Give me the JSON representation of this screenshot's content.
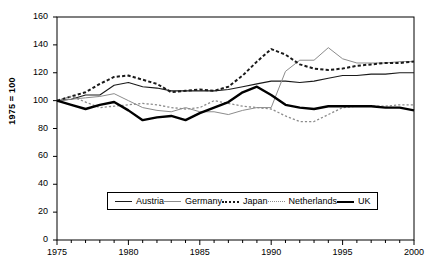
{
  "chart_data": {
    "type": "line",
    "title": "",
    "subtitle": "",
    "xlabel": "",
    "ylabel": "1975 = 100",
    "xlim": [
      1975,
      2000
    ],
    "ylim": [
      0,
      160
    ],
    "grid": false,
    "legend_position": "bottom-center",
    "ytick_labels": [
      "0",
      "20",
      "40",
      "60",
      "80",
      "100",
      "120",
      "140",
      "160"
    ],
    "yticks": [
      0,
      20,
      40,
      60,
      80,
      100,
      120,
      140,
      160
    ],
    "xtick_labels": [
      "1975",
      "1980",
      "1985",
      "1990",
      "1995",
      "2000"
    ],
    "xticks": [
      1975,
      1980,
      1985,
      1990,
      1995,
      2000
    ],
    "minor_xtick_interval": 1,
    "x": [
      1975,
      1976,
      1977,
      1978,
      1979,
      1980,
      1981,
      1982,
      1983,
      1984,
      1985,
      1986,
      1987,
      1988,
      1989,
      1990,
      1991,
      1992,
      1993,
      1994,
      1995,
      1996,
      1997,
      1998,
      1999,
      2000
    ],
    "series": [
      {
        "name": "Austria",
        "style": "solid-thin-dark",
        "color": "#1a1a1a",
        "values": [
          100,
          101,
          104,
          104,
          111,
          113,
          110,
          109,
          107,
          107,
          107,
          107,
          108,
          110,
          112,
          114,
          114,
          113,
          114,
          116,
          118,
          118,
          119,
          119,
          120,
          120
        ]
      },
      {
        "name": "Germany",
        "style": "solid-thin-gray",
        "color": "#8c8c8c",
        "values": [
          100,
          101,
          102,
          103,
          105,
          100,
          95,
          93,
          92,
          95,
          92,
          92,
          90,
          93,
          95,
          95,
          121,
          129,
          129,
          138,
          130,
          127,
          127,
          127,
          128,
          128
        ]
      },
      {
        "name": "Japan",
        "style": "dotted-bold-dark",
        "color": "#1a1a1a",
        "values": [
          100,
          103,
          106,
          112,
          117,
          118,
          115,
          112,
          106,
          107,
          108,
          107,
          110,
          118,
          128,
          137,
          133,
          126,
          123,
          122,
          123,
          125,
          126,
          127,
          127,
          128
        ]
      },
      {
        "name": "Netherlands",
        "style": "dotted-thin-gray",
        "color": "#8c8c8c",
        "values": [
          100,
          103,
          99,
          95,
          96,
          97,
          98,
          97,
          95,
          94,
          95,
          100,
          98,
          96,
          95,
          94,
          89,
          85,
          85,
          90,
          95,
          96,
          96,
          96,
          97,
          97
        ]
      },
      {
        "name": "UK",
        "style": "solid-bold-dark",
        "color": "#000000",
        "values": [
          100,
          97,
          94,
          97,
          99,
          93,
          86,
          88,
          89,
          86,
          91,
          95,
          99,
          106,
          110,
          104,
          97,
          95,
          94,
          96,
          96,
          96,
          96,
          95,
          95,
          93
        ]
      }
    ]
  },
  "legend": {
    "items": [
      {
        "label": "Austria"
      },
      {
        "label": "Germany"
      },
      {
        "label": "Japan"
      },
      {
        "label": "Netherlands"
      },
      {
        "label": "UK"
      }
    ]
  }
}
